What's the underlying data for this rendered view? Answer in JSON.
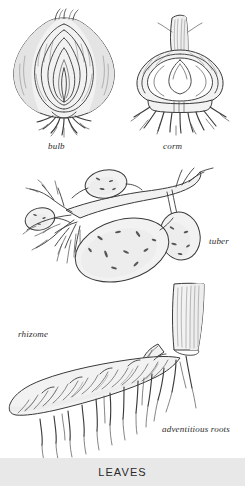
{
  "diagram": {
    "figures": [
      {
        "id": "bulb",
        "label": "bulb",
        "icon": "bulb-cross-section-icon"
      },
      {
        "id": "corm",
        "label": "corm",
        "icon": "corm-cross-section-icon"
      },
      {
        "id": "tuber",
        "label": "tuber",
        "icon": "tuber-with-stolons-icon"
      },
      {
        "id": "rhizome",
        "label": "rhizome",
        "icon": "rhizome-icon"
      },
      {
        "id": "advroots",
        "label": "adventitious roots",
        "icon": "adventitious-roots-icon"
      }
    ],
    "footer": {
      "heading": "LEAVES"
    },
    "colors": {
      "background": "#ffffff",
      "ink": "#3a3a3a",
      "fill": "#f2f2f2",
      "footer_band": "#e8e8e8",
      "footer_text": "#2a2a2a"
    }
  }
}
